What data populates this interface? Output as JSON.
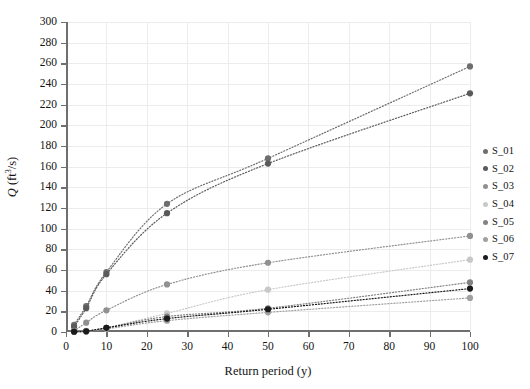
{
  "chart_data": {
    "type": "scatter",
    "title": "",
    "xlabel": "Return period (y)",
    "ylabel": "Q (ft3/s)",
    "ylabel_display": "Q (ft³/s)",
    "xlim": [
      0,
      100
    ],
    "ylim": [
      0,
      300
    ],
    "x_ticks": [
      0,
      10,
      20,
      30,
      40,
      50,
      60,
      70,
      80,
      90,
      100
    ],
    "y_ticks": [
      0,
      20,
      40,
      60,
      80,
      100,
      120,
      140,
      160,
      180,
      200,
      220,
      240,
      260,
      280,
      300
    ],
    "grid": true,
    "legend_position": "right",
    "x": [
      2,
      5,
      10,
      25,
      50,
      100
    ],
    "series": [
      {
        "name": "S_01",
        "color": "#6e6e6e",
        "values": [
          7,
          25,
          58,
          124,
          168,
          257
        ]
      },
      {
        "name": "S_02",
        "color": "#5a5a5a",
        "values": [
          5,
          23,
          56,
          115,
          163,
          231
        ]
      },
      {
        "name": "S_03",
        "color": "#909090",
        "values": [
          1,
          9,
          21,
          46,
          67,
          93
        ]
      },
      {
        "name": "S_04",
        "color": "#c8c8c8",
        "values": [
          0.5,
          1,
          4,
          18,
          41,
          70
        ]
      },
      {
        "name": "S_05",
        "color": "#838383",
        "values": [
          0.4,
          0.8,
          4,
          15,
          23,
          48
        ]
      },
      {
        "name": "S_06",
        "color": "#a0a0a0",
        "values": [
          0.3,
          0.6,
          3,
          11,
          19,
          33
        ]
      },
      {
        "name": "S_07",
        "color": "#1b1b1b",
        "values": [
          0.3,
          0.7,
          4,
          13,
          22,
          42
        ]
      }
    ]
  },
  "legend": {
    "items": [
      {
        "label": "S_01",
        "color": "#6e6e6e"
      },
      {
        "label": "S_02",
        "color": "#5a5a5a"
      },
      {
        "label": "S_03",
        "color": "#909090"
      },
      {
        "label": "S_04",
        "color": "#c8c8c8"
      },
      {
        "label": "S_05",
        "color": "#838383"
      },
      {
        "label": "S_06",
        "color": "#a0a0a0"
      },
      {
        "label": "S_07",
        "color": "#1b1b1b"
      }
    ]
  }
}
